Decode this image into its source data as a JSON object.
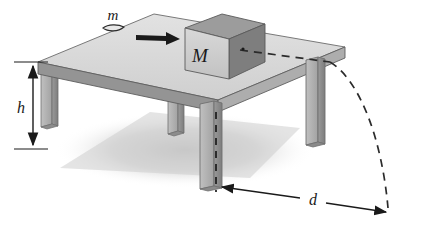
{
  "figure": {
    "name": "projectile-off-table-diagram",
    "caption_labels": {
      "small_mass": "m",
      "block_mass": "M",
      "table_height": "h",
      "landing_distance": "d"
    },
    "colors": {
      "background": "#ffffff",
      "table_top_face": "#d9d9d9",
      "table_top_edge_front": "#8f8f8f",
      "table_top_edge_right": "#a8a8a8",
      "leg_front_face": "#b5b5b5",
      "leg_side_face": "#8a8a8a",
      "block_front_face": "#cfcfcf",
      "block_top_face": "#9a9a9a",
      "block_right_face": "#7e7e7e",
      "outline": "#4a4a4a",
      "ink": "#1a1a1a",
      "ground_shadow": "#d0d0d0",
      "dashed_trajectory": "#2b2b2b"
    },
    "elements": {
      "table": {
        "name": "table",
        "legs_count": 4,
        "top_shape": "parallelogram-perspective"
      },
      "block": {
        "name": "block-M",
        "label": "M",
        "shape": "cube"
      },
      "bullet": {
        "name": "bullet-m",
        "label": "m",
        "shape": "bullet"
      },
      "velocity_arrow": {
        "name": "bullet-velocity-arrow",
        "direction": "right"
      },
      "height_dimension": {
        "name": "height-dimension",
        "label": "h",
        "arrow_style": "double-headed-vertical"
      },
      "distance_dimension": {
        "name": "distance-dimension",
        "label": "d",
        "arrow_style": "double-headed-horizontal"
      },
      "trajectory": {
        "name": "projectile-trajectory",
        "style": "dashed-arc"
      },
      "drop_line": {
        "name": "vertical-drop-line",
        "style": "dashed-vertical"
      }
    }
  }
}
